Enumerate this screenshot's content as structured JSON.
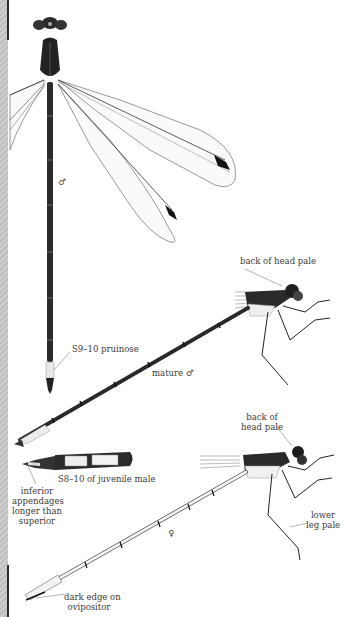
{
  "illustration": {
    "subject": "damselfly plate",
    "figures": [
      {
        "id": "dorsal-male",
        "sex_symbol": "♂"
      },
      {
        "id": "lateral-mature-male",
        "caption": "mature ♂"
      },
      {
        "id": "lateral-female",
        "sex_symbol": "♀"
      },
      {
        "id": "juvenile-male-tail-detail"
      }
    ],
    "annotations": {
      "dorsal_sex": "♂",
      "s9_10": "S9–10 pruinose",
      "back_of_head_male": "back of head pale",
      "mature_male": "mature ♂",
      "s8_10_juvenile": "S8–10 of juvenile male",
      "inferior_line1": "inferior",
      "inferior_line2": "appendages",
      "inferior_line3": "longer than",
      "inferior_line4": "superior",
      "back_of_head_female_line1": "back of",
      "back_of_head_female_line2": "head pale",
      "lower_leg_line1": "lower",
      "lower_leg_line2": "leg pale",
      "female_sex": "♀",
      "dark_edge_line1": "dark edge on",
      "dark_edge_line2": "ovipositor"
    },
    "colors": {
      "ink": "#1e1e1e",
      "wing_vein": "#555555",
      "pale": "#e8e8e8",
      "strip": "#c6c6c6"
    }
  }
}
